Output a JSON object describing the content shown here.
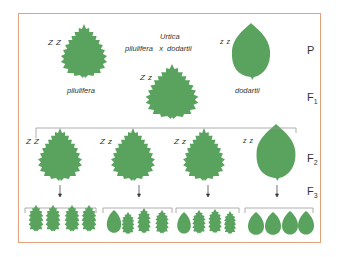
{
  "diagram": {
    "title_line1": "Urtica",
    "title_line2": "pilulifera   x  dodartii",
    "colors": {
      "leaf": "#5aa35e",
      "frame": "#e4a07a",
      "bracket": "#999999",
      "text": "#333333"
    },
    "generations": {
      "P": "P",
      "F1_base": "F",
      "F1_sub": "1",
      "F2_base": "F",
      "F2_sub": "2",
      "F3_base": "F",
      "F3_sub": "3"
    },
    "parents": [
      {
        "name": "pilulifera",
        "genotype": "Z Z",
        "leaf_type": "serrated-heart"
      },
      {
        "name": "dodartii",
        "genotype": "z z",
        "leaf_type": "smooth-oval"
      }
    ],
    "f1": {
      "genotype": "Z z",
      "leaf_type": "serrated-heart"
    },
    "f2": [
      {
        "genotype": "Z Z",
        "leaf_type": "serrated-heart"
      },
      {
        "genotype": "Z z",
        "leaf_type": "serrated-heart"
      },
      {
        "genotype": "Z z",
        "leaf_type": "serrated-heart"
      },
      {
        "genotype": "z z",
        "leaf_type": "smooth-oval"
      }
    ],
    "f3_groups": [
      {
        "parent": "Z Z",
        "offspring": [
          "serrated",
          "serrated",
          "serrated",
          "serrated"
        ]
      },
      {
        "parent": "Z z",
        "offspring": [
          "smooth",
          "serrated",
          "serrated",
          "serrated"
        ]
      },
      {
        "parent": "Z z",
        "offspring": [
          "smooth",
          "serrated",
          "serrated",
          "serrated"
        ]
      },
      {
        "parent": "z z",
        "offspring": [
          "smooth",
          "smooth",
          "smooth",
          "smooth"
        ]
      }
    ]
  }
}
